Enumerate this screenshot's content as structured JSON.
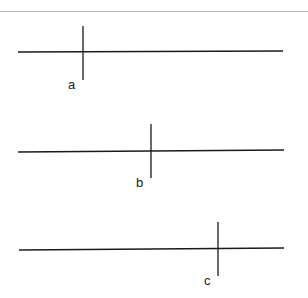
{
  "diagram": {
    "title": "",
    "line_color": "#1a1a1a",
    "lines": [
      {
        "label": "a",
        "y": 52,
        "x_start": 18,
        "x_end": 283,
        "tick_x": 83,
        "tick_top": 26,
        "tick_bottom": 80,
        "label_x": 68,
        "label_y": 78
      },
      {
        "label": "b",
        "y": 151,
        "x_start": 18,
        "x_end": 284,
        "tick_x": 151,
        "tick_top": 124,
        "tick_bottom": 178,
        "label_x": 136,
        "label_y": 176
      },
      {
        "label": "c",
        "y": 250,
        "x_start": 19,
        "x_end": 284,
        "tick_x": 218,
        "tick_top": 222,
        "tick_bottom": 276,
        "label_x": 204,
        "label_y": 274
      }
    ]
  }
}
